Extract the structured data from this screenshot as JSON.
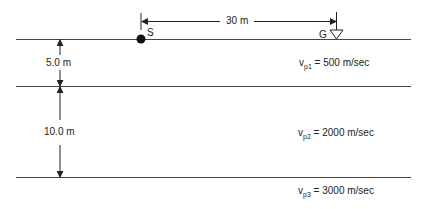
{
  "diagram": {
    "source_label": "S",
    "geophone_label": "G",
    "offset_label": "30 m",
    "layers": [
      {
        "thickness_label": "5.0 m",
        "velocity_symbol": "v",
        "velocity_sub": "p1",
        "velocity_value": " = 500 m/sec"
      },
      {
        "thickness_label": "10.0 m",
        "velocity_symbol": "v",
        "velocity_sub": "p2",
        "velocity_value": " = 2000 m/sec"
      },
      {
        "thickness_label": "",
        "velocity_symbol": "v",
        "velocity_sub": "p3",
        "velocity_value": " = 3000 m/sec"
      }
    ],
    "colors": {
      "line": "#333333",
      "text": "#222222",
      "background": "#ffffff"
    }
  }
}
